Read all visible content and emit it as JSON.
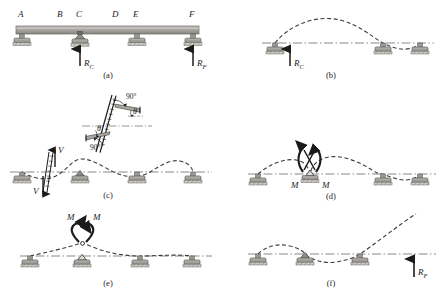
{
  "figure": {
    "type": "structural-beam-analysis-diagram",
    "background": "#ffffff",
    "ink": "#1b1b1b",
    "beam_fill_top": "#b9b7b2",
    "beam_fill_bottom": "#8d8b86",
    "support_fill": "#9c9a95",
    "hatch_color": "#6f6d69"
  },
  "panels": [
    {
      "id": "a",
      "caption": "(a)",
      "kind": "beam",
      "node_labels": [
        "A",
        "B",
        "C",
        "D",
        "E",
        "F"
      ],
      "node_x": [
        22,
        61,
        80,
        116,
        137,
        193
      ],
      "support_x": [
        22,
        80,
        137,
        193
      ],
      "support_types": [
        "roller",
        "pin",
        "roller",
        "roller"
      ],
      "beam_y": 32,
      "forces": [
        {
          "label": "R",
          "sub": "C",
          "x": 80,
          "dir": "up"
        },
        {
          "label": "R",
          "sub": "F",
          "x": 193,
          "dir": "up"
        }
      ]
    },
    {
      "id": "b",
      "caption": "(b)",
      "kind": "released",
      "redundant": "R_C",
      "forces": [
        {
          "label": "R",
          "sub": "C",
          "x": 290,
          "dir": "up"
        }
      ],
      "support_x": [
        275,
        383,
        420
      ],
      "deflection": "large upward hump between first and second support, small downward dip beyond"
    },
    {
      "id": "c",
      "caption": "(c)",
      "kind": "released-shear",
      "redundant": "V",
      "forces": [
        {
          "label": "V",
          "dir": "up"
        },
        {
          "label": "V",
          "dir": "down"
        }
      ],
      "angles": [
        "90°",
        "90°"
      ],
      "theta": [
        "θ",
        "θ"
      ],
      "support_x": [
        22,
        80,
        137,
        193
      ],
      "detail_note": "inset shows relative vertical slip of cut faces remaining perpendicular"
    },
    {
      "id": "d",
      "caption": "(d)",
      "kind": "released-moment",
      "redundant": "M",
      "forces": [
        {
          "label": "M",
          "side": "left"
        },
        {
          "label": "M",
          "side": "right"
        }
      ],
      "support_x": [
        258,
        310,
        390,
        420
      ],
      "deflection": "hinge rotation at second support, humps on both sides"
    },
    {
      "id": "e",
      "caption": "(e)",
      "kind": "released-moment",
      "redundant": "M",
      "forces": [
        {
          "label": "M",
          "side": "left"
        },
        {
          "label": "M",
          "side": "right"
        }
      ],
      "support_x": [
        30,
        82,
        140,
        192
      ],
      "deflection": "peaked rotation at second support"
    },
    {
      "id": "f",
      "caption": "(f)",
      "kind": "released",
      "redundant": "R_F",
      "forces": [
        {
          "label": "R",
          "sub": "F",
          "x": 414,
          "dir": "up"
        }
      ],
      "support_x": [
        258,
        305,
        360
      ],
      "deflection": "small hump, dip, then steeply rising cantilever end"
    }
  ]
}
